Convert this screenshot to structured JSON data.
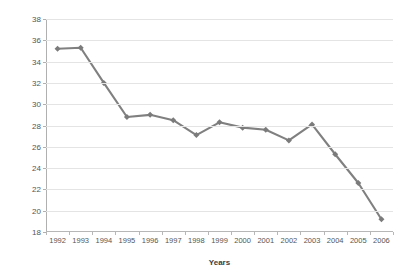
{
  "chart_data": {
    "type": "line",
    "title": "",
    "xlabel": "Years",
    "ylabel": "% Poverty Rates (y < $R121)",
    "categories": [
      "1992",
      "1993",
      "1994",
      "1995",
      "1996",
      "1997",
      "1998",
      "1999",
      "2000",
      "2001",
      "2002",
      "2003",
      "2004",
      "2005",
      "2006"
    ],
    "values": [
      35.2,
      35.3,
      32.0,
      28.8,
      29.0,
      28.5,
      27.1,
      28.3,
      27.8,
      27.6,
      26.6,
      28.1,
      25.3,
      22.6,
      19.2
    ],
    "series": [
      {
        "name": "% Poverty Rates (y < $R121)",
        "values": [
          35.2,
          35.3,
          32.0,
          28.8,
          29.0,
          28.5,
          27.1,
          28.3,
          27.8,
          27.6,
          26.6,
          28.1,
          25.3,
          22.6,
          19.2
        ]
      }
    ],
    "ylim": [
      18,
      38
    ],
    "yticks": [
      18,
      20,
      22,
      24,
      26,
      28,
      30,
      32,
      34,
      36,
      38
    ],
    "ytick_labels": [
      "18",
      "20",
      "22",
      "24",
      "26",
      "28",
      "30",
      "32",
      "34",
      "36",
      "38"
    ],
    "grid": true,
    "legend": false,
    "legend_position": "none",
    "marker": "diamond",
    "line_color": "#808080",
    "marker_color": "#7b7b7b",
    "grid_color": "#e4e4e4",
    "axis_color": "#b0b0b0",
    "background": "#ffffff"
  }
}
